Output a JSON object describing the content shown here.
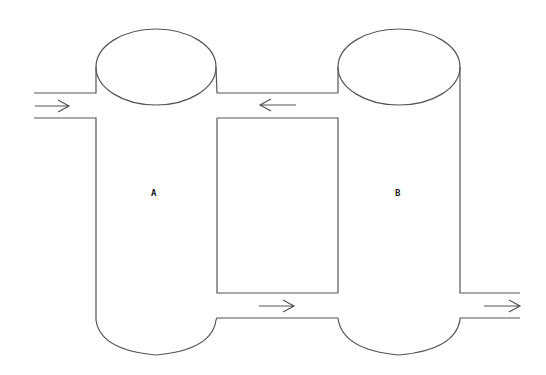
{
  "diagram": {
    "type": "flow-diagram",
    "colors": {
      "line": "#555555",
      "label": "#222222",
      "background": "#ffffff"
    },
    "tanks": [
      {
        "id": "A",
        "label": "A"
      },
      {
        "id": "B",
        "label": "B"
      }
    ],
    "flows": [
      {
        "name": "inlet-to-A",
        "direction": "right"
      },
      {
        "name": "B-to-A-top",
        "direction": "left"
      },
      {
        "name": "A-to-B-bottom",
        "direction": "right"
      },
      {
        "name": "B-outlet",
        "direction": "right"
      }
    ]
  }
}
